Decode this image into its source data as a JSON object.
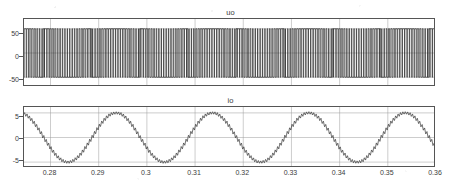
{
  "figure": {
    "background": "#ffffff",
    "line_color": "#202020",
    "grid_color": "#9a9a9a",
    "axis_color": "#555555"
  },
  "subplots": [
    {
      "id": "uo",
      "title": "uo",
      "ytick_labels": [
        "50",
        "0",
        "-50"
      ],
      "ytick_values": [
        50,
        0,
        -50
      ],
      "xtick_labels": [],
      "ylim": [
        -70,
        70
      ],
      "xlim": [
        0.2745,
        0.36
      ]
    },
    {
      "id": "io",
      "title": "io",
      "ytick_labels": [
        "5",
        "0",
        "-5"
      ],
      "ytick_values": [
        5,
        0,
        -5
      ],
      "xtick_labels": [
        "0.28",
        "0.29",
        "0.3",
        "0.31",
        "0.32",
        "0.33",
        "0.34",
        "0.35",
        "0.36"
      ],
      "xtick_values": [
        0.28,
        0.29,
        0.3,
        0.31,
        0.32,
        0.33,
        0.34,
        0.35,
        0.36
      ],
      "ylim": [
        -6.2,
        6.2
      ],
      "xlim": [
        0.2745,
        0.36
      ]
    }
  ],
  "chart_data": [
    {
      "type": "line",
      "id": "uo",
      "title": "uo",
      "xlabel": "",
      "ylabel": "",
      "xlim": [
        0.2745,
        0.36
      ],
      "ylim": [
        -70,
        70
      ],
      "grid": true,
      "legend": null,
      "description": "Unipolar SPWM inverter output voltage: rectangular pulse train switching between +50 V and -50 V, carrier frequency about 2 kHz, modulating sine at 50 Hz. Pulse widths vary sinusoidally so that the local average follows a 50 Hz sine.",
      "waveform": "pwm",
      "amplitude": 50,
      "levels": [
        50,
        -50
      ],
      "fundamental_frequency_hz": 50,
      "carrier_frequency_hz": 2000,
      "modulation_index": 0.85,
      "yticks": [
        50,
        0,
        -50
      ],
      "x": [
        0.2745,
        0.28,
        0.29,
        0.3,
        0.31,
        0.32,
        0.33,
        0.34,
        0.35,
        0.36
      ],
      "values": [
        -50,
        50,
        -50,
        50,
        -50,
        50,
        -50,
        50,
        -50,
        50
      ]
    },
    {
      "type": "line",
      "id": "io",
      "title": "io",
      "xlabel": "",
      "ylabel": "",
      "xlim": [
        0.2745,
        0.36
      ],
      "ylim": [
        -6.2,
        6.2
      ],
      "grid": true,
      "legend": null,
      "description": "Inverter output current: 50 Hz sinusoid of about 5 A peak with superimposed high-frequency switching ripple of roughly 0.5 A peak-to-peak.",
      "waveform": "sine-with-ripple",
      "amplitude": 5.0,
      "fundamental_frequency_hz": 50,
      "ripple_frequency_hz": 2000,
      "ripple_amplitude": 0.45,
      "phase_deg": -155,
      "yticks": [
        5,
        0,
        -5
      ],
      "xticks": [
        0.28,
        0.29,
        0.3,
        0.31,
        0.32,
        0.33,
        0.34,
        0.35,
        0.36
      ],
      "x": [
        0.2745,
        0.28,
        0.286,
        0.29,
        0.296,
        0.3,
        0.306,
        0.31,
        0.316,
        0.32,
        0.326,
        0.33,
        0.336,
        0.34,
        0.346,
        0.35,
        0.356,
        0.36
      ],
      "values": [
        -3.6,
        -1.9,
        4.9,
        3.0,
        -4.6,
        -1.2,
        5.0,
        2.3,
        -4.9,
        -0.5,
        5.0,
        1.6,
        -5.0,
        0.2,
        5.0,
        0.9,
        -4.9,
        -0.3
      ]
    }
  ]
}
